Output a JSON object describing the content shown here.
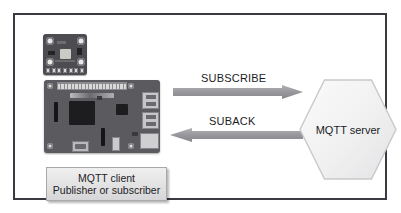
{
  "diagram": {
    "frame": {
      "border_color": "#3a3a40",
      "background_color": "#ffffff"
    },
    "client": {
      "label_line_1": "MQTT client",
      "label_line_2": "Publisher or subscriber",
      "box_fill_color": "#e6e6e7",
      "box_border_color": "#a9a9ad",
      "hardware": [
        {
          "name": "sensor-breakout-board",
          "board_color": "#4c4c51",
          "description": "small sensor breakout board with four mounting holes and a pin header"
        },
        {
          "name": "single-board-computer",
          "board_color": "#5a5a5f",
          "description": "single board computer with GPIO header, USB ports, ethernet port and micro USB power"
        }
      ]
    },
    "arrows": [
      {
        "name": "subscribe",
        "label": "SUBSCRIBE",
        "direction": "right",
        "from": "MQTT client",
        "to": "MQTT server",
        "color": "#9a9a9e"
      },
      {
        "name": "suback",
        "label": "SUBACK",
        "direction": "left",
        "from": "MQTT server",
        "to": "MQTT client",
        "color": "#9a9a9e"
      }
    ],
    "server": {
      "label": "MQTT server",
      "shape": "hexagon",
      "fill_color": "#f2f2f3",
      "border_color": "#c9c9cc"
    }
  }
}
